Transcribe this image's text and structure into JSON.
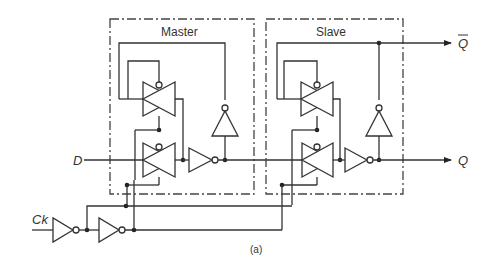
{
  "diagram": {
    "blocks": [
      {
        "label": "Master"
      },
      {
        "label": "Slave"
      }
    ],
    "inputs": {
      "data": "D",
      "clock": "Ck"
    },
    "outputs": {
      "q": "Q",
      "q_bar": "Q"
    },
    "caption": "(a)"
  }
}
